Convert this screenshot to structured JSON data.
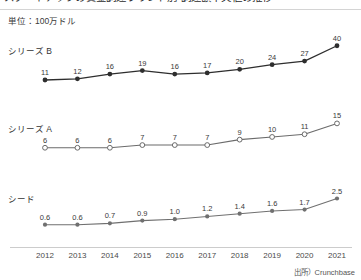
{
  "header": {
    "title": "スタートアップの資金調達ラウンド別 調達額中央値の推移",
    "title_visible": false,
    "unit_label": "単位：100万ドル"
  },
  "axis": {
    "years": [
      "2012",
      "2013",
      "2014",
      "2015",
      "2016",
      "2017",
      "2018",
      "2019",
      "2020",
      "2021"
    ]
  },
  "footer": {
    "source": "出所）Crunchbase"
  },
  "panels": [
    {
      "key": "series_b",
      "label": "シリーズ B",
      "marker": "filled-dark",
      "line_color": "#2e2e2e"
    },
    {
      "key": "series_a",
      "label": "シリーズ A",
      "marker": "hollow-gray",
      "line_color": "#6b6b6b"
    },
    {
      "key": "seed",
      "label": "シード",
      "marker": "filled-gray",
      "line_color": "#707070"
    }
  ],
  "chart_data": {
    "type": "line",
    "title": "スタートアップの資金調達ラウンド別 調達額中央値の推移",
    "subtitle": "単位：100万ドル",
    "xlabel": "",
    "ylabel": "単位：100万ドル",
    "grid": false,
    "legend_position": "inline-left",
    "layout": "small-multiples-stacked",
    "source": "出所）Crunchbase",
    "categories": [
      "2012",
      "2013",
      "2014",
      "2015",
      "2016",
      "2017",
      "2018",
      "2019",
      "2020",
      "2021"
    ],
    "series": [
      {
        "name": "シリーズ B",
        "values": [
          11,
          12,
          16,
          19,
          16,
          17,
          20,
          24,
          27,
          40
        ],
        "labels": [
          "11",
          "12",
          "16",
          "19",
          "16",
          "17",
          "20",
          "24",
          "27",
          "40"
        ],
        "marker": "filled-dark",
        "color": "#2e2e2e",
        "ylim": [
          0,
          44
        ]
      },
      {
        "name": "シリーズ A",
        "values": [
          6,
          6,
          6,
          7,
          7,
          7,
          9,
          10,
          11,
          15
        ],
        "labels": [
          "6",
          "6",
          "6",
          "7",
          "7",
          "7",
          "9",
          "10",
          "11",
          "15"
        ],
        "marker": "hollow-gray",
        "color": "#6b6b6b",
        "ylim": [
          0,
          17
        ]
      },
      {
        "name": "シード",
        "values": [
          0.6,
          0.6,
          0.7,
          0.9,
          1.0,
          1.2,
          1.4,
          1.6,
          1.7,
          2.5
        ],
        "labels": [
          "0.6",
          "0.6",
          "0.7",
          "0.9",
          "1.0",
          "1.2",
          "1.4",
          "1.6",
          "1.7",
          "2.5"
        ],
        "marker": "filled-gray",
        "color": "#707070",
        "ylim": [
          0,
          2.9
        ]
      }
    ]
  }
}
